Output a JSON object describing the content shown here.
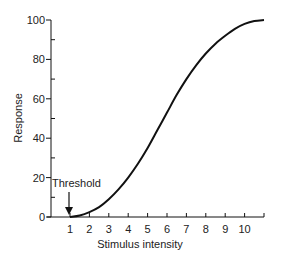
{
  "chart_data": {
    "type": "line",
    "title": "",
    "xlabel": "Stimulus intensity",
    "ylabel": "Response",
    "xlim": [
      0,
      11
    ],
    "ylim": [
      0,
      100
    ],
    "x_ticks": [
      1,
      2,
      3,
      4,
      5,
      6,
      7,
      8,
      9,
      10
    ],
    "y_ticks": [
      0,
      20,
      40,
      60,
      80,
      100
    ],
    "y_minor_ticks": [
      10,
      30,
      50,
      70,
      90
    ],
    "grid": false,
    "series": [
      {
        "name": "Response curve",
        "x": [
          1,
          1.5,
          2,
          2.5,
          3,
          3.5,
          4,
          4.5,
          5,
          5.5,
          6,
          6.5,
          7,
          7.5,
          8,
          8.5,
          9,
          9.5,
          10,
          10.5,
          11
        ],
        "values": [
          0,
          0.8,
          2.5,
          5,
          9,
          14,
          20,
          27,
          35,
          44,
          53,
          62,
          70,
          77,
          83,
          88,
          92,
          95.5,
          98,
          99.5,
          100
        ]
      }
    ],
    "annotations": [
      {
        "text": "Threshold",
        "x": 1,
        "y": 0,
        "arrow": "down"
      }
    ]
  },
  "labels": {
    "xlabel": "Stimulus intensity",
    "ylabel": "Response",
    "threshold": "Threshold"
  }
}
